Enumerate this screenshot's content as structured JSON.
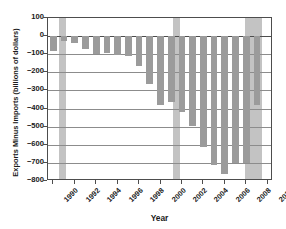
{
  "chart_data": {
    "type": "bar",
    "title": "",
    "xlabel": "Year",
    "ylabel": "Exports Minus Imports (billions of  dollars)",
    "ylim": [
      -800,
      100
    ],
    "yticks": [
      100,
      0,
      -100,
      -200,
      -300,
      -400,
      -500,
      -600,
      -700,
      -800
    ],
    "ytick_labels": [
      "100",
      "0",
      "−100",
      "−200",
      "−300",
      "−400",
      "−500",
      "−600",
      "−700",
      "−800"
    ],
    "xlim": [
      1989.5,
      2010.5
    ],
    "xticks": [
      1990,
      1992,
      1994,
      1996,
      1998,
      2000,
      2002,
      2004,
      2006,
      2008,
      2010
    ],
    "xtick_labels": [
      "1990",
      "1992",
      "1994",
      "1996",
      "1998",
      "2000",
      "2002",
      "2004",
      "2006",
      "2008",
      "2010"
    ],
    "grid": true,
    "legend": "none",
    "bar_color": "#9b9b9b",
    "recession_band_color": "#b8b8b8",
    "axis_color": "#4d4d4d",
    "categories": [
      1990,
      1991,
      1992,
      1993,
      1994,
      1995,
      1996,
      1997,
      1998,
      1999,
      2000,
      2001,
      2002,
      2003,
      2004,
      2005,
      2006,
      2007,
      2008,
      2009
    ],
    "values": [
      -80,
      -28,
      -39,
      -70,
      -98,
      -96,
      -104,
      -108,
      -166,
      -263,
      -378,
      -365,
      -421,
      -494,
      -610,
      -714,
      -759,
      -700,
      -698,
      -381
    ],
    "recessions": [
      {
        "label": "1990-1991 recession",
        "start": 1990.5,
        "end": 1991.2
      },
      {
        "label": "2001 recession",
        "start": 2001.2,
        "end": 2001.8
      },
      {
        "label": "2008-2009 recession",
        "start": 2007.9,
        "end": 2009.5
      }
    ]
  },
  "axes": {
    "y_title": "Exports Minus Imports (billions of  dollars)",
    "x_title": "Year"
  }
}
